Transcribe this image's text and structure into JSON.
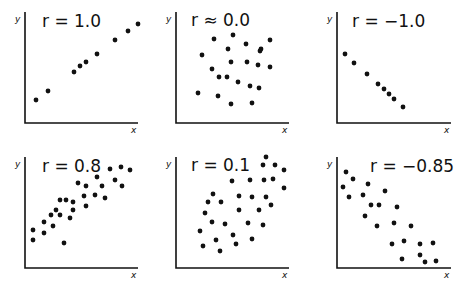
{
  "chart_data": [
    {
      "type": "scatter",
      "title": "r = 1.0",
      "xlabel": "x",
      "ylabel": "y",
      "grid": false,
      "origin": [
        25,
        123
      ],
      "xaxis_end": 138,
      "yaxis_top": 12,
      "label_pos": [
        42,
        27
      ],
      "points": [
        [
          36,
          100
        ],
        [
          48,
          91
        ],
        [
          74,
          72
        ],
        [
          80,
          66
        ],
        [
          86,
          62
        ],
        [
          97,
          54
        ],
        [
          115,
          40
        ],
        [
          128,
          31
        ],
        [
          138,
          24
        ]
      ]
    },
    {
      "type": "scatter",
      "title": "r ≈ 0.0",
      "xlabel": "x",
      "ylabel": "y",
      "grid": false,
      "origin": [
        176,
        123
      ],
      "xaxis_end": 289,
      "yaxis_top": 12,
      "label_pos": [
        191,
        26
      ],
      "points": [
        [
          214,
          39
        ],
        [
          233,
          35
        ],
        [
          246,
          44
        ],
        [
          270,
          40
        ],
        [
          228,
          49
        ],
        [
          261,
          49
        ],
        [
          202,
          55
        ],
        [
          260,
          51
        ],
        [
          231,
          62
        ],
        [
          247,
          62
        ],
        [
          258,
          65
        ],
        [
          270,
          67
        ],
        [
          212,
          69
        ],
        [
          219,
          77
        ],
        [
          227,
          77
        ],
        [
          238,
          82
        ],
        [
          250,
          86
        ],
        [
          259,
          88
        ],
        [
          198,
          93
        ],
        [
          218,
          96
        ],
        [
          231,
          104
        ],
        [
          252,
          103
        ]
      ]
    },
    {
      "type": "scatter",
      "title": "r = −1.0",
      "xlabel": "x",
      "ylabel": "y",
      "grid": false,
      "origin": [
        337,
        123
      ],
      "xaxis_end": 451,
      "yaxis_top": 12,
      "label_pos": [
        352,
        27
      ],
      "points": [
        [
          345,
          54
        ],
        [
          354,
          63
        ],
        [
          367,
          74
        ],
        [
          378,
          84
        ],
        [
          384,
          89
        ],
        [
          389,
          94
        ],
        [
          394,
          99
        ],
        [
          403,
          107
        ]
      ]
    },
    {
      "type": "scatter",
      "title": "r = 0.8",
      "xlabel": "x",
      "ylabel": "y",
      "grid": false,
      "origin": [
        25,
        268
      ],
      "xaxis_end": 138,
      "yaxis_top": 157,
      "label_pos": [
        42,
        172
      ],
      "points": [
        [
          33,
          240
        ],
        [
          33,
          230
        ],
        [
          44,
          233
        ],
        [
          44,
          222
        ],
        [
          51,
          215
        ],
        [
          53,
          226
        ],
        [
          56,
          210
        ],
        [
          60,
          200
        ],
        [
          60,
          215
        ],
        [
          64,
          243
        ],
        [
          66,
          200
        ],
        [
          70,
          218
        ],
        [
          73,
          202
        ],
        [
          73,
          210
        ],
        [
          78,
          183
        ],
        [
          86,
          186
        ],
        [
          84,
          196
        ],
        [
          86,
          206
        ],
        [
          95,
          195
        ],
        [
          97,
          177
        ],
        [
          102,
          186
        ],
        [
          105,
          198
        ],
        [
          110,
          169
        ],
        [
          115,
          180
        ],
        [
          121,
          167
        ],
        [
          122,
          186
        ],
        [
          130,
          170
        ]
      ]
    },
    {
      "type": "scatter",
      "title": "r = 0.1",
      "xlabel": "x",
      "ylabel": "y",
      "grid": false,
      "origin": [
        176,
        268
      ],
      "xaxis_end": 289,
      "yaxis_top": 157,
      "label_pos": [
        191,
        171
      ],
      "points": [
        [
          266,
          157
        ],
        [
          263,
          165
        ],
        [
          275,
          165
        ],
        [
          284,
          170
        ],
        [
          232,
          181
        ],
        [
          250,
          180
        ],
        [
          264,
          180
        ],
        [
          273,
          179
        ],
        [
          284,
          188
        ],
        [
          213,
          194
        ],
        [
          208,
          202
        ],
        [
          221,
          202
        ],
        [
          239,
          196
        ],
        [
          252,
          197
        ],
        [
          266,
          197
        ],
        [
          271,
          205
        ],
        [
          205,
          213
        ],
        [
          239,
          210
        ],
        [
          259,
          210
        ],
        [
          212,
          222
        ],
        [
          225,
          224
        ],
        [
          248,
          223
        ],
        [
          263,
          225
        ],
        [
          200,
          231
        ],
        [
          233,
          235
        ],
        [
          216,
          240
        ],
        [
          203,
          246
        ],
        [
          236,
          244
        ],
        [
          252,
          239
        ],
        [
          220,
          251
        ]
      ]
    },
    {
      "type": "scatter",
      "title": "r = −0.85",
      "xlabel": "x",
      "ylabel": "y",
      "grid": false,
      "origin": [
        337,
        268
      ],
      "xaxis_end": 451,
      "yaxis_top": 157,
      "label_pos": [
        370,
        172
      ],
      "points": [
        [
          346,
          172
        ],
        [
          353,
          179
        ],
        [
          343,
          187
        ],
        [
          349,
          197
        ],
        [
          368,
          184
        ],
        [
          363,
          195
        ],
        [
          385,
          191
        ],
        [
          371,
          205
        ],
        [
          379,
          205
        ],
        [
          365,
          216
        ],
        [
          397,
          207
        ],
        [
          377,
          226
        ],
        [
          394,
          223
        ],
        [
          411,
          226
        ],
        [
          392,
          244
        ],
        [
          404,
          241
        ],
        [
          420,
          244
        ],
        [
          433,
          243
        ],
        [
          420,
          255
        ],
        [
          402,
          259
        ],
        [
          425,
          262
        ],
        [
          436,
          261
        ]
      ]
    }
  ],
  "panels": [
    {
      "title": "r = 1.0",
      "xlabel": "x",
      "ylabel": "y"
    },
    {
      "title": "r ≈ 0.0",
      "xlabel": "x",
      "ylabel": "y"
    },
    {
      "title": "r = −1.0",
      "xlabel": "x",
      "ylabel": "y"
    },
    {
      "title": "r = 0.8",
      "xlabel": "x",
      "ylabel": "y"
    },
    {
      "title": "r = 0.1",
      "xlabel": "x",
      "ylabel": "y"
    },
    {
      "title": "r = −0.85",
      "xlabel": "x",
      "ylabel": "y"
    }
  ]
}
